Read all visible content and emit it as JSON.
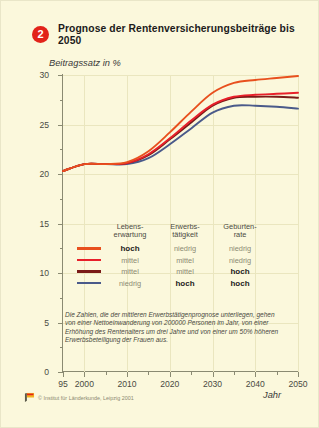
{
  "header": {
    "badge": "2",
    "title": "Prognose der Rentenversicherungsbeiträge bis 2050"
  },
  "axes": {
    "ylabel": "Beitragssatz in %",
    "xlabel": "Jahr",
    "yticks": [
      "0",
      "5",
      "10",
      "15",
      "20",
      "25",
      "30"
    ],
    "xticks": [
      "95",
      "2000",
      "2010",
      "2020",
      "2030",
      "2040",
      "2050"
    ]
  },
  "legend": {
    "headers": [
      "Lebens-\nerwartung",
      "Erwerbs-\ntätigkeit",
      "Geburten-\nrate"
    ],
    "header_1_line1": "Lebens-",
    "header_1_line2": "erwartung",
    "header_2_line1": "Erwerbs-",
    "header_2_line2": "tätigkeit",
    "header_3_line1": "Geburten-",
    "header_3_line2": "rate",
    "rows": [
      {
        "color": "#e8501e",
        "c1": "hoch",
        "c1b": true,
        "c2": "niedrig",
        "c2b": false,
        "c3": "niedrig",
        "c3b": false
      },
      {
        "color": "#e8202a",
        "c1": "mittel",
        "c1b": false,
        "c2": "mittel",
        "c2b": false,
        "c3": "niedrig",
        "c3b": false
      },
      {
        "color": "#7a1a18",
        "c1": "mittel",
        "c1b": false,
        "c2": "mittel",
        "c2b": false,
        "c3": "hoch",
        "c3b": true
      },
      {
        "color": "#4a5a8a",
        "c1": "niedrig",
        "c1b": false,
        "c2": "hoch",
        "c2b": true,
        "c3": "hoch",
        "c3b": true
      }
    ]
  },
  "note": "Die Zahlen, die der mittleren Erwerbstätigenprognose unterliegen, gehen von einer Nettoeinwanderung von 200000 Personen im Jahr, von einer Erhöhung des Rentenalters um drei Jahre und von einer um 50% höheren Erwerbsbeteiligung der Frauen aus.",
  "footer": {
    "copyright": "© Institut für Länderkunde, Leipzig 2001"
  },
  "chart_data": {
    "type": "line",
    "title": "Prognose der Rentenversicherungsbeiträge bis 2050",
    "xlabel": "Jahr",
    "ylabel": "Beitragssatz in %",
    "xlim": [
      1995,
      2050
    ],
    "ylim": [
      0,
      30
    ],
    "grid": true,
    "legend_position": "inside-center",
    "x": [
      1995,
      2000,
      2005,
      2010,
      2015,
      2020,
      2025,
      2030,
      2035,
      2040,
      2045,
      2050
    ],
    "series": [
      {
        "name": "hoch / niedrig / niedrig",
        "color": "#e8501e",
        "values": [
          20.3,
          21.0,
          21.0,
          21.2,
          22.3,
          24.2,
          26.3,
          28.2,
          29.2,
          29.5,
          29.7,
          29.9
        ]
      },
      {
        "name": "mittel / mittel / niedrig",
        "color": "#e8202a",
        "values": [
          20.3,
          21.0,
          21.0,
          21.1,
          22.0,
          23.6,
          25.4,
          27.0,
          27.8,
          28.0,
          28.1,
          28.2
        ]
      },
      {
        "name": "mittel / mittel / hoch",
        "color": "#7a1a18",
        "values": [
          20.3,
          21.0,
          21.0,
          21.1,
          21.9,
          23.5,
          25.2,
          26.9,
          27.7,
          27.8,
          27.8,
          27.7
        ]
      },
      {
        "name": "niedrig / hoch / hoch",
        "color": "#4a5a8a",
        "values": [
          20.3,
          21.0,
          21.0,
          21.0,
          21.6,
          23.0,
          24.6,
          26.2,
          26.9,
          26.9,
          26.8,
          26.6
        ]
      }
    ]
  }
}
